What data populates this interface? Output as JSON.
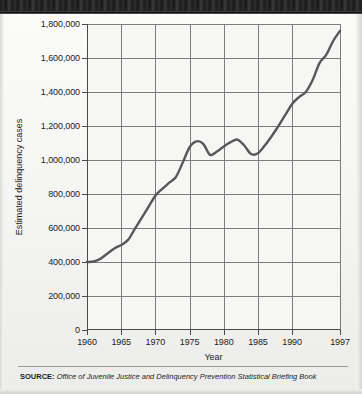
{
  "figure": {
    "background_color": "#f2f2f0",
    "banner_color": "#242424"
  },
  "source": {
    "label": "SOURCE:",
    "text": "Office of Juvenile Justice and Delinquency Prevention Statistical Briefing Book"
  },
  "chart_data": {
    "type": "line",
    "title": "",
    "xlabel": "Year",
    "ylabel": "Estimated delinquency cases",
    "xlim": [
      1960,
      1997
    ],
    "ylim": [
      0,
      1800000
    ],
    "grid": true,
    "legend": null,
    "line_color": "#57585a",
    "xticks": [
      1960,
      1965,
      1970,
      1975,
      1980,
      1985,
      1990,
      1997
    ],
    "xtick_labels": [
      "1960",
      "1965",
      "1970",
      "1975",
      "1980",
      "1985",
      "1990",
      "1997"
    ],
    "yticks": [
      0,
      200000,
      400000,
      600000,
      800000,
      1000000,
      1200000,
      1400000,
      1600000,
      1800000
    ],
    "ytick_labels": [
      "0",
      "200,000",
      "400,000",
      "600,000",
      "800,000",
      "1,000,000",
      "1,200,000",
      "1,400,000",
      "1,600,000",
      "1,800,000"
    ],
    "x": [
      1960,
      1961,
      1962,
      1963,
      1964,
      1965,
      1966,
      1967,
      1968,
      1969,
      1970,
      1971,
      1972,
      1973,
      1974,
      1975,
      1976,
      1977,
      1978,
      1979,
      1980,
      1981,
      1982,
      1983,
      1984,
      1985,
      1986,
      1987,
      1988,
      1989,
      1990,
      1991,
      1992,
      1993,
      1994,
      1995,
      1996,
      1997
    ],
    "values": [
      400000,
      403000,
      420000,
      450000,
      480000,
      500000,
      530000,
      595000,
      660000,
      725000,
      790000,
      830000,
      865000,
      900000,
      985000,
      1075000,
      1110000,
      1095000,
      1030000,
      1050000,
      1080000,
      1105000,
      1120000,
      1085000,
      1035000,
      1040000,
      1085000,
      1140000,
      1200000,
      1265000,
      1330000,
      1370000,
      1400000,
      1470000,
      1570000,
      1620000,
      1700000,
      1760000
    ],
    "series_name": "Estimated delinquency cases"
  }
}
